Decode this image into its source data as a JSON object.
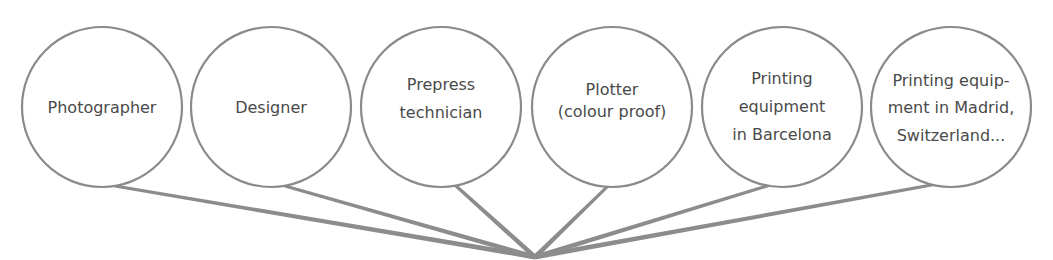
{
  "diagram": {
    "type": "fan-in",
    "hub": {
      "x": 535,
      "y": 257
    },
    "colors": {
      "circle_stroke": "#8a8a8a",
      "link": "#8c8c8c",
      "text": "#4a4a4a"
    },
    "nodes": [
      {
        "id": "photographer",
        "cx": 102,
        "cy": 107,
        "r": 80,
        "attach": [
          115,
          186
        ],
        "lines": [
          "Photographer"
        ]
      },
      {
        "id": "designer",
        "cx": 271,
        "cy": 107,
        "r": 80,
        "attach": [
          285,
          186
        ],
        "lines": [
          "Designer"
        ]
      },
      {
        "id": "prepress-technician",
        "cx": 441,
        "cy": 107,
        "r": 80,
        "attach": [
          455,
          185
        ],
        "lines": [
          "Prepress",
          "technician"
        ]
      },
      {
        "id": "plotter",
        "cx": 612,
        "cy": 107,
        "r": 80,
        "attach": [
          608,
          186
        ],
        "lines": [
          "Plotter",
          "(colour proof)"
        ]
      },
      {
        "id": "printing-barcelona",
        "cx": 782,
        "cy": 107,
        "r": 80,
        "attach": [
          770,
          185
        ],
        "lines": [
          "Printing",
          "equipment",
          "in Barcelona"
        ]
      },
      {
        "id": "printing-madrid-switzerland",
        "cx": 951,
        "cy": 107,
        "r": 80,
        "attach": [
          937,
          184
        ],
        "lines": [
          "Printing equip-",
          "ment in Madrid,",
          "Switzerland..."
        ]
      }
    ]
  }
}
